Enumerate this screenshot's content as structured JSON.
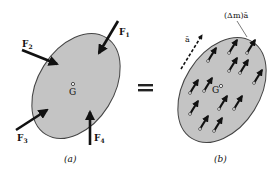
{
  "diagram": {
    "colors": {
      "body_fill": "#c4c4c4",
      "body_stroke": "#444444",
      "arrow": "#111111",
      "background": "#ffffff"
    },
    "panel_a": {
      "caption": "(a)",
      "center_label": "G",
      "forces": [
        {
          "label": "F",
          "sub": "1"
        },
        {
          "label": "F",
          "sub": "2"
        },
        {
          "label": "F",
          "sub": "3"
        },
        {
          "label": "F",
          "sub": "4"
        }
      ]
    },
    "equals_symbol": "=",
    "panel_b": {
      "caption": "(b)",
      "center_label": "G",
      "acceleration_label": "ā",
      "element_label": "(Δm)ā",
      "element_count": 16
    }
  }
}
